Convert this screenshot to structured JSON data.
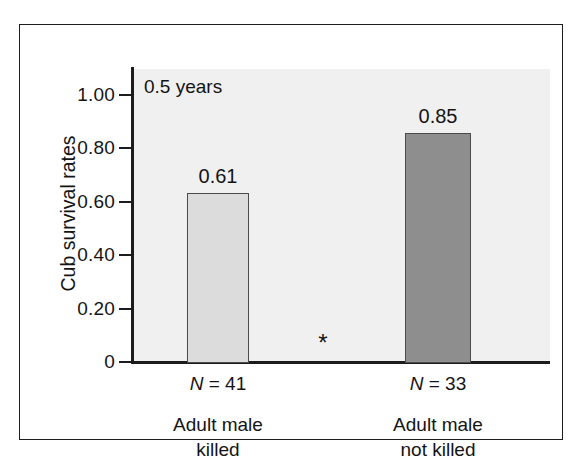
{
  "figure": {
    "annotation": "0.5 years",
    "significance_marker": "*"
  },
  "chart_data": {
    "type": "bar",
    "title": "",
    "subtitle": "",
    "annotation": "0.5 years",
    "xlabel": "",
    "ylabel": "Cub survival rates",
    "categories": [
      "Adult male killed",
      "Adult male not killed"
    ],
    "category_lines": [
      [
        "Adult male",
        "killed"
      ],
      [
        "Adult male",
        "not killed"
      ]
    ],
    "values": [
      0.61,
      0.85
    ],
    "bar_tops_plotted": [
      0.63,
      0.855
    ],
    "data_labels": [
      "0.61",
      "0.85"
    ],
    "sample_sizes": [
      41,
      33
    ],
    "sample_size_labels": [
      "N = 41",
      "N = 33"
    ],
    "n_symbol": "N",
    "n_equals_0": " = 41",
    "n_equals_1": " = 33",
    "ylim": [
      0,
      1.0
    ],
    "yticks": [
      0,
      0.2,
      0.4,
      0.6,
      0.8,
      1.0
    ],
    "ytick_labels": [
      "0",
      "0.20",
      "0.40",
      "0.60",
      "0.80",
      "1.00"
    ],
    "grid": false,
    "legend": null,
    "legend_position": "none",
    "bar_colors": [
      "#dcdcdc",
      "#8e8e8e"
    ],
    "bar_border_color": "#4a4a4a",
    "plot_background": "#f0f0f0",
    "axis_color": "#1c1c1c",
    "text_color": "#141414",
    "significance_annotation": "*"
  }
}
